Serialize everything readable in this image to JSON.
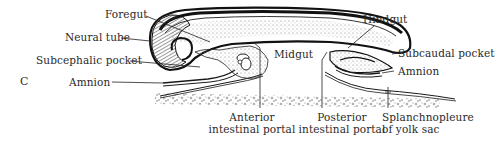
{
  "figure": {
    "panel_letter": "C",
    "labels": {
      "foregut": "Foregut",
      "neural_tube": "Neural tube",
      "subcephalic_pocket": "Subcephalic pocket",
      "amnion_left": "Amnion",
      "hindgut": "Hindgut",
      "subcaudal_pocket": "Subcaudal pocket",
      "amnion_right": "Amnion",
      "midgut": "Midgut",
      "anterior_portal_line1": "Anterior",
      "anterior_portal_line2": "intestinal portal",
      "posterior_portal_line1": "Posterior",
      "posterior_portal_line2": "intestinal portal",
      "splanchnopleure_line1": "Splanchnopleure",
      "splanchnopleure_line2": "of yolk sac"
    },
    "colors": {
      "ink": "#1a1a1a",
      "label": "#2a2a2a",
      "background": "#ffffff",
      "stipple": "#8a8a8a"
    }
  }
}
